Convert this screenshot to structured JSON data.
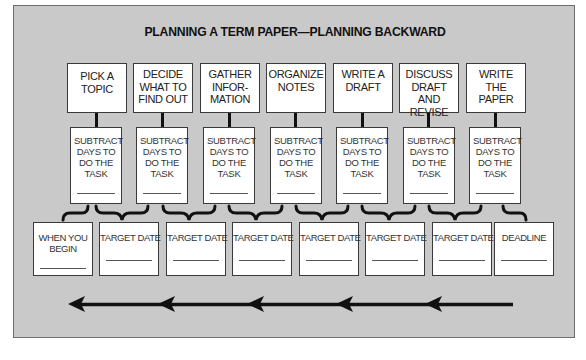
{
  "title": "PLANNING A TERM PAPER—PLANNING BACKWARD",
  "tasks": [
    {
      "label": "PICK A TOPIC"
    },
    {
      "label": "DECIDE WHAT TO FIND OUT"
    },
    {
      "label": "GATHER INFOR-MATION"
    },
    {
      "label": "ORGANIZE NOTES"
    },
    {
      "label": "WRITE A DRAFT"
    },
    {
      "label": "DISCUSS DRAFT AND REVISE"
    },
    {
      "label": "WRITE THE PAPER"
    }
  ],
  "subtract_label": "SUBTRACT DAYS TO DO THE TASK",
  "dates": [
    {
      "label": "WHEN YOU BEGIN"
    },
    {
      "label": "TARGET DATE"
    },
    {
      "label": "TARGET DATE"
    },
    {
      "label": "TARGET DATE"
    },
    {
      "label": "TARGET DATE"
    },
    {
      "label": "TARGET DATE"
    },
    {
      "label": "TARGET DATE"
    },
    {
      "label": "DEADLINE"
    }
  ],
  "arrow": {
    "direction": "right-to-left",
    "segments": 5
  },
  "colors": {
    "panel": "#c9c9c9",
    "box": "#ffffff",
    "ink": "#111111"
  }
}
